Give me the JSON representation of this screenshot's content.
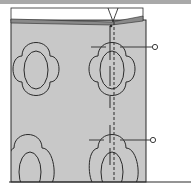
{
  "diagram": {
    "type": "sewing-illustration",
    "colors": {
      "fabric": "#c8c8c8",
      "fabric_fold": "#8a8a8a",
      "outline": "#2a2a2a",
      "pointer": "#3a3a3a",
      "top_bar": "#a9a9a9",
      "background": "#ffffff"
    },
    "elements": {
      "fabric_panel": "fabric",
      "thread_loop": "thread",
      "stitch_line": "dashed-center-stitch",
      "motifs": [
        {
          "row": "top",
          "col": "left",
          "shape": "clover-with-oval"
        },
        {
          "row": "top",
          "col": "right",
          "shape": "clover-with-oval"
        },
        {
          "row": "bottom",
          "col": "left",
          "shape": "clover-with-oval"
        },
        {
          "row": "bottom",
          "col": "right",
          "shape": "clover-with-oval"
        }
      ],
      "callouts": [
        {
          "position": "upper",
          "marker": "circle"
        },
        {
          "position": "lower",
          "marker": "circle"
        }
      ]
    }
  }
}
